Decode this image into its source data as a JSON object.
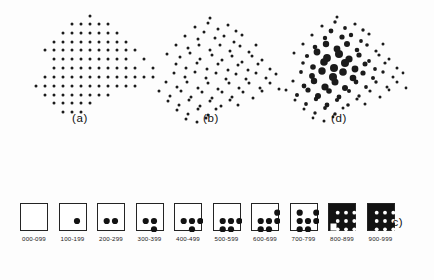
{
  "figure": {
    "background_color": "#fdfdfd",
    "ink_color": "#1b1b1b"
  },
  "panels": [
    {
      "id": "a",
      "label": "(a)",
      "description": "regular lattice of uniform small dots"
    },
    {
      "id": "b",
      "label": "(b)",
      "description": "jittered random positions, uniform small dots"
    },
    {
      "id": "d",
      "label": "(d)",
      "description": "jittered positions with graduated dot sizes, largest at centre"
    }
  ],
  "legend": {
    "label": "(c)",
    "box_color": "#ffffff",
    "border_color": "#242424",
    "dot_color": "#121212",
    "items": [
      {
        "range": "000-099",
        "filled": 0
      },
      {
        "range": "100-199",
        "filled": 1
      },
      {
        "range": "200-299",
        "filled": 2
      },
      {
        "range": "300-399",
        "filled": 3
      },
      {
        "range": "400-499",
        "filled": 4
      },
      {
        "range": "500-599",
        "filled": 5
      },
      {
        "range": "600-699",
        "filled": 6
      },
      {
        "range": "700-799",
        "filled": 7
      },
      {
        "range": "800-899",
        "filled": 8
      },
      {
        "range": "900-999",
        "filled": 9
      }
    ]
  },
  "chart_data": {
    "type": "scatter",
    "title": "",
    "xlabel": "",
    "ylabel": "",
    "grid": false,
    "legend_position": "bottom",
    "panels": [
      {
        "name": "(a)",
        "point_style": "uniform-small",
        "radius": 1.5,
        "points": [
          [
            62,
            4
          ],
          [
            44,
            12
          ],
          [
            53,
            12
          ],
          [
            62,
            12
          ],
          [
            71,
            12
          ],
          [
            80,
            12
          ],
          [
            35,
            21
          ],
          [
            44,
            21
          ],
          [
            53,
            21
          ],
          [
            62,
            21
          ],
          [
            71,
            21
          ],
          [
            80,
            21
          ],
          [
            89,
            21
          ],
          [
            26,
            30
          ],
          [
            35,
            30
          ],
          [
            44,
            30
          ],
          [
            53,
            30
          ],
          [
            62,
            30
          ],
          [
            71,
            30
          ],
          [
            80,
            30
          ],
          [
            89,
            30
          ],
          [
            98,
            30
          ],
          [
            17,
            38
          ],
          [
            26,
            38
          ],
          [
            35,
            38
          ],
          [
            44,
            38
          ],
          [
            53,
            38
          ],
          [
            62,
            38
          ],
          [
            71,
            38
          ],
          [
            80,
            38
          ],
          [
            89,
            38
          ],
          [
            98,
            38
          ],
          [
            107,
            38
          ],
          [
            26,
            47
          ],
          [
            35,
            47
          ],
          [
            44,
            47
          ],
          [
            53,
            47
          ],
          [
            62,
            47
          ],
          [
            71,
            47
          ],
          [
            80,
            47
          ],
          [
            89,
            47
          ],
          [
            98,
            47
          ],
          [
            116,
            47
          ],
          [
            26,
            56
          ],
          [
            35,
            56
          ],
          [
            44,
            56
          ],
          [
            53,
            56
          ],
          [
            62,
            56
          ],
          [
            71,
            56
          ],
          [
            80,
            56
          ],
          [
            89,
            56
          ],
          [
            98,
            56
          ],
          [
            107,
            56
          ],
          [
            125,
            56
          ],
          [
            17,
            65
          ],
          [
            26,
            65
          ],
          [
            35,
            65
          ],
          [
            44,
            65
          ],
          [
            53,
            65
          ],
          [
            62,
            65
          ],
          [
            71,
            65
          ],
          [
            80,
            65
          ],
          [
            89,
            65
          ],
          [
            98,
            65
          ],
          [
            107,
            65
          ],
          [
            116,
            65
          ],
          [
            125,
            65
          ],
          [
            8,
            74
          ],
          [
            17,
            74
          ],
          [
            26,
            74
          ],
          [
            35,
            74
          ],
          [
            44,
            74
          ],
          [
            53,
            74
          ],
          [
            62,
            74
          ],
          [
            71,
            74
          ],
          [
            80,
            74
          ],
          [
            89,
            74
          ],
          [
            98,
            74
          ],
          [
            107,
            74
          ],
          [
            17,
            83
          ],
          [
            26,
            83
          ],
          [
            35,
            83
          ],
          [
            44,
            83
          ],
          [
            53,
            83
          ],
          [
            62,
            83
          ],
          [
            71,
            83
          ],
          [
            80,
            83
          ],
          [
            26,
            91
          ],
          [
            35,
            91
          ],
          [
            44,
            91
          ],
          [
            53,
            91
          ],
          [
            62,
            91
          ],
          [
            35,
            100
          ],
          [
            44,
            100
          ],
          [
            53,
            100
          ]
        ]
      },
      {
        "name": "(b)",
        "point_style": "uniform-small",
        "radius": 1.5,
        "points": [
          [
            58,
            6
          ],
          [
            43,
            15
          ],
          [
            56,
            11
          ],
          [
            66,
            17
          ],
          [
            76,
            13
          ],
          [
            84,
            19
          ],
          [
            33,
            24
          ],
          [
            46,
            27
          ],
          [
            52,
            20
          ],
          [
            63,
            26
          ],
          [
            72,
            24
          ],
          [
            82,
            30
          ],
          [
            90,
            23
          ],
          [
            24,
            33
          ],
          [
            36,
            36
          ],
          [
            47,
            33
          ],
          [
            58,
            38
          ],
          [
            68,
            33
          ],
          [
            78,
            39
          ],
          [
            88,
            34
          ],
          [
            97,
            40
          ],
          [
            104,
            33
          ],
          [
            15,
            42
          ],
          [
            28,
            45
          ],
          [
            38,
            41
          ],
          [
            48,
            47
          ],
          [
            60,
            43
          ],
          [
            70,
            48
          ],
          [
            80,
            44
          ],
          [
            90,
            50
          ],
          [
            100,
            44
          ],
          [
            110,
            48
          ],
          [
            24,
            52
          ],
          [
            34,
            56
          ],
          [
            45,
            51
          ],
          [
            55,
            57
          ],
          [
            66,
            52
          ],
          [
            76,
            58
          ],
          [
            86,
            53
          ],
          [
            96,
            58
          ],
          [
            106,
            52
          ],
          [
            118,
            57
          ],
          [
            22,
            61
          ],
          [
            33,
            65
          ],
          [
            43,
            60
          ],
          [
            54,
            66
          ],
          [
            64,
            61
          ],
          [
            74,
            67
          ],
          [
            84,
            62
          ],
          [
            94,
            67
          ],
          [
            104,
            61
          ],
          [
            114,
            66
          ],
          [
            124,
            62
          ],
          [
            14,
            70
          ],
          [
            25,
            75
          ],
          [
            35,
            70
          ],
          [
            46,
            76
          ],
          [
            56,
            71
          ],
          [
            66,
            77
          ],
          [
            77,
            71
          ],
          [
            87,
            76
          ],
          [
            97,
            71
          ],
          [
            108,
            76
          ],
          [
            118,
            71
          ],
          [
            127,
            77
          ],
          [
            7,
            79
          ],
          [
            18,
            84
          ],
          [
            29,
            79
          ],
          [
            39,
            85
          ],
          [
            50,
            80
          ],
          [
            60,
            86
          ],
          [
            70,
            80
          ],
          [
            80,
            85
          ],
          [
            91,
            80
          ],
          [
            101,
            86
          ],
          [
            110,
            79
          ],
          [
            16,
            89
          ],
          [
            27,
            93
          ],
          [
            37,
            88
          ],
          [
            48,
            94
          ],
          [
            58,
            89
          ],
          [
            69,
            94
          ],
          [
            78,
            88
          ],
          [
            86,
            93
          ],
          [
            25,
            98
          ],
          [
            36,
            102
          ],
          [
            46,
            97
          ],
          [
            56,
            103
          ],
          [
            64,
            97
          ],
          [
            34,
            107
          ],
          [
            45,
            110
          ],
          [
            54,
            106
          ]
        ]
      },
      {
        "name": "(d)",
        "point_style": "graduated",
        "radius_min": 1.4,
        "radius_max": 4.0,
        "points": [
          [
            59,
            5,
            1.5
          ],
          [
            44,
            14,
            1.6
          ],
          [
            57,
            10,
            1.7
          ],
          [
            67,
            16,
            1.9
          ],
          [
            77,
            12,
            1.6
          ],
          [
            85,
            18,
            1.7
          ],
          [
            34,
            23,
            1.6
          ],
          [
            47,
            26,
            2.2
          ],
          [
            53,
            19,
            2.4
          ],
          [
            64,
            25,
            2.6
          ],
          [
            73,
            23,
            2.2
          ],
          [
            83,
            29,
            1.9
          ],
          [
            91,
            22,
            1.6
          ],
          [
            25,
            32,
            1.6
          ],
          [
            37,
            35,
            2.3
          ],
          [
            48,
            32,
            3.2
          ],
          [
            59,
            37,
            3.4
          ],
          [
            69,
            32,
            3.0
          ],
          [
            79,
            38,
            2.3
          ],
          [
            89,
            33,
            1.8
          ],
          [
            98,
            39,
            1.6
          ],
          [
            105,
            32,
            1.5
          ],
          [
            16,
            41,
            1.5
          ],
          [
            29,
            44,
            2.1
          ],
          [
            39,
            40,
            3.4
          ],
          [
            49,
            46,
            3.9
          ],
          [
            61,
            42,
            4.0
          ],
          [
            71,
            47,
            3.6
          ],
          [
            81,
            43,
            2.6
          ],
          [
            91,
            49,
            1.9
          ],
          [
            101,
            43,
            1.6
          ],
          [
            111,
            47,
            1.5
          ],
          [
            25,
            51,
            1.8
          ],
          [
            35,
            55,
            2.8
          ],
          [
            46,
            50,
            3.8
          ],
          [
            56,
            56,
            4.0
          ],
          [
            67,
            51,
            4.0
          ],
          [
            77,
            57,
            3.4
          ],
          [
            87,
            52,
            2.5
          ],
          [
            97,
            57,
            1.9
          ],
          [
            107,
            51,
            1.6
          ],
          [
            119,
            56,
            1.5
          ],
          [
            23,
            60,
            1.9
          ],
          [
            34,
            64,
            2.9
          ],
          [
            44,
            59,
            3.7
          ],
          [
            55,
            65,
            4.0
          ],
          [
            65,
            60,
            3.8
          ],
          [
            75,
            66,
            3.3
          ],
          [
            85,
            61,
            2.6
          ],
          [
            95,
            66,
            2.0
          ],
          [
            105,
            60,
            1.7
          ],
          [
            115,
            65,
            1.5
          ],
          [
            125,
            61,
            1.4
          ],
          [
            15,
            69,
            1.6
          ],
          [
            26,
            74,
            2.4
          ],
          [
            36,
            69,
            3.2
          ],
          [
            47,
            75,
            3.6
          ],
          [
            57,
            70,
            3.5
          ],
          [
            67,
            76,
            3.0
          ],
          [
            78,
            70,
            2.4
          ],
          [
            88,
            75,
            1.9
          ],
          [
            98,
            70,
            1.7
          ],
          [
            109,
            75,
            1.5
          ],
          [
            119,
            70,
            1.5
          ],
          [
            128,
            76,
            1.4
          ],
          [
            8,
            78,
            1.5
          ],
          [
            19,
            83,
            2.0
          ],
          [
            30,
            78,
            2.6
          ],
          [
            40,
            84,
            3.0
          ],
          [
            51,
            79,
            2.8
          ],
          [
            61,
            85,
            2.4
          ],
          [
            71,
            79,
            2.0
          ],
          [
            81,
            84,
            1.7
          ],
          [
            92,
            79,
            1.6
          ],
          [
            102,
            85,
            1.5
          ],
          [
            111,
            78,
            1.4
          ],
          [
            17,
            88,
            1.5
          ],
          [
            28,
            92,
            1.9
          ],
          [
            38,
            87,
            2.2
          ],
          [
            49,
            93,
            2.4
          ],
          [
            59,
            88,
            2.1
          ],
          [
            70,
            93,
            1.8
          ],
          [
            79,
            87,
            1.6
          ],
          [
            87,
            92,
            1.5
          ],
          [
            26,
            97,
            1.5
          ],
          [
            37,
            101,
            1.7
          ],
          [
            47,
            96,
            1.9
          ],
          [
            57,
            102,
            1.7
          ],
          [
            65,
            96,
            1.5
          ],
          [
            35,
            106,
            1.4
          ],
          [
            46,
            109,
            1.5
          ],
          [
            55,
            105,
            1.4
          ]
        ]
      }
    ]
  }
}
